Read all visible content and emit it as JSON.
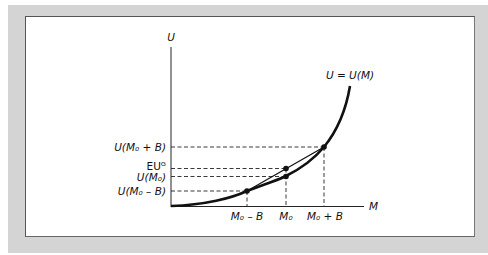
{
  "figure": {
    "type": "expected-utility diagram (risk-loving, convex utility)",
    "axes": {
      "y_label": "U",
      "x_label": "M"
    },
    "curve_label": "U = U(M)",
    "y_tick_labels": {
      "u_high": "U(M₀ + B)",
      "eu": "EUᴳ",
      "u_mid": "U(M₀)",
      "u_low": "U(M₀ – B)"
    },
    "x_tick_labels": {
      "m_low": "M₀ – B",
      "m_mid": "M₀",
      "m_high": "M₀ + B"
    },
    "points": [
      {
        "name": "low",
        "x": "M0 - B",
        "y": "U(M0 - B)"
      },
      {
        "name": "expected-utility",
        "x": "M0",
        "y": "EU_G"
      },
      {
        "name": "certain",
        "x": "M0",
        "y": "U(M0)"
      },
      {
        "name": "high",
        "x": "M0 + B",
        "y": "U(M0 + B)"
      }
    ],
    "colors": {
      "frame": "#d4d4d4",
      "panel": "#ffffff",
      "ink": "#111111"
    }
  }
}
